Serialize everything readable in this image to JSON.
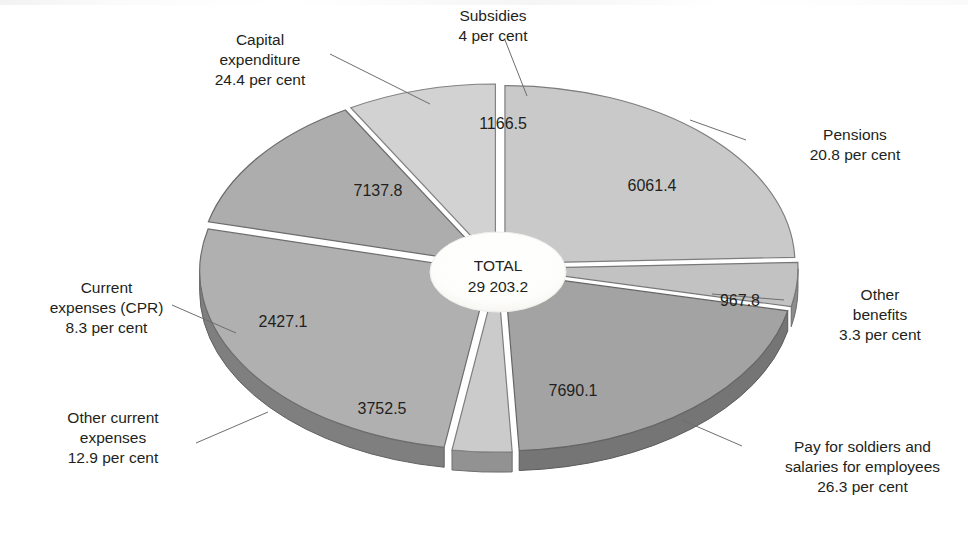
{
  "chart_data": {
    "type": "pie",
    "title": "",
    "subtitle": "",
    "xlabel": "",
    "ylabel": "",
    "legend_position": "callout-labels",
    "grid": false,
    "exploded": true,
    "three_d": true,
    "center_label": {
      "title": "TOTAL",
      "value": "29 203.2"
    },
    "total": 29203.2,
    "unit_text": "per cent",
    "categories": [
      "Capital expenditure",
      "Subsidies",
      "Pensions",
      "Other benefits",
      "Pay for soldiers and salaries for employees",
      "Other current expenses",
      "Current expenses (CPR)"
    ],
    "values": [
      7137.8,
      1166.5,
      6061.4,
      967.8,
      7690.1,
      3752.5,
      2427.1
    ],
    "percentages": [
      24.4,
      4.0,
      20.8,
      3.3,
      26.3,
      12.9,
      8.3
    ],
    "slices": [
      {
        "name": "capital-expenditure",
        "label_lines": [
          "Capital",
          "expenditure",
          "24.4 per cent"
        ],
        "value": "7137.8",
        "percent": "24.4 per cent",
        "color": "#c9c9c9"
      },
      {
        "name": "subsidies",
        "label_lines": [
          "Subsidies",
          "4 per cent"
        ],
        "value": "1166.5",
        "percent": "4 per cent",
        "color": "#c2c2c2"
      },
      {
        "name": "pensions",
        "label_lines": [
          "Pensions",
          "20.8 per cent"
        ],
        "value": "6061.4",
        "percent": "20.8 per cent",
        "color": "#a3a3a3"
      },
      {
        "name": "other-benefits",
        "label_lines": [
          "Other",
          "benefits",
          "3.3 per cent"
        ],
        "value": "967.8",
        "percent": "3.3 per cent",
        "color": "#cbcbcb"
      },
      {
        "name": "pay-for-soldiers-and-salaries",
        "label_lines": [
          "Pay for soldiers and",
          "salaries for employees",
          "26.3 per cent"
        ],
        "value": "7690.1",
        "percent": "26.3 per cent",
        "color": "#b0b0b0"
      },
      {
        "name": "other-current-expenses",
        "label_lines": [
          "Other current",
          "expenses",
          "12.9 per cent"
        ],
        "value": "3752.5",
        "percent": "12.9 per cent",
        "color": "#adadad"
      },
      {
        "name": "current-expenses-cpr",
        "label_lines": [
          "Current",
          "expenses (CPR)",
          "8.3 per cent"
        ],
        "value": "2427.1",
        "percent": "8.3 per cent",
        "color": "#d2d2d2"
      }
    ]
  },
  "labels": {
    "capital_expenditure": {
      "l1": "Capital",
      "l2": "expenditure",
      "l3": "24.4 per cent"
    },
    "subsidies": {
      "l1": "Subsidies",
      "l2": "4 per cent"
    },
    "pensions": {
      "l1": "Pensions",
      "l2": "20.8 per cent"
    },
    "other_benefits": {
      "l1": "Other",
      "l2": "benefits",
      "l3": "3.3 per cent"
    },
    "pay_soldiers": {
      "l1": "Pay for soldiers and",
      "l2": "salaries for employees",
      "l3": "26.3 per cent"
    },
    "other_current": {
      "l1": "Other current",
      "l2": "expenses",
      "l3": "12.9 per cent"
    },
    "current_cpr": {
      "l1": "Current",
      "l2": "expenses (CPR)",
      "l3": "8.3 per cent"
    }
  },
  "values": {
    "capital_expenditure": "7137.8",
    "subsidies": "1166.5",
    "pensions": "6061.4",
    "other_benefits": "967.8",
    "pay_soldiers": "7690.1",
    "other_current": "3752.5",
    "current_cpr": "2427.1"
  },
  "center": {
    "title": "TOTAL",
    "value": "29 203.2"
  }
}
